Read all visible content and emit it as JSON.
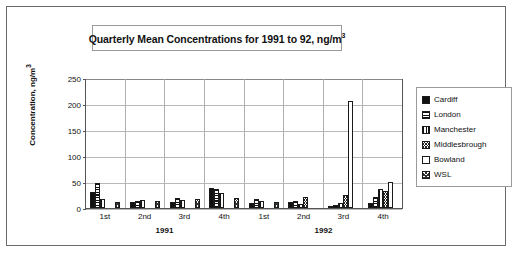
{
  "chart_data": {
    "type": "bar",
    "xlabel": "",
    "ylabel": "Concentration, ng/m³",
    "ylim": [
      0,
      250
    ],
    "yticks": [
      0,
      50,
      100,
      150,
      200,
      250
    ],
    "grid": true,
    "legend_position": "right",
    "categories": [
      "1st",
      "2nd",
      "3rd",
      "4th",
      "1st",
      "2nd",
      "3rd",
      "4th"
    ],
    "group_labels": [
      "1991",
      "1992"
    ],
    "series": [
      {
        "name": "Cardiff",
        "pattern": "solid-black",
        "values": [
          30,
          11,
          12,
          38,
          10,
          12,
          4,
          10
        ]
      },
      {
        "name": "London",
        "pattern": "horizontal-lines",
        "values": [
          48,
          14,
          20,
          37,
          17,
          14,
          6,
          22
        ]
      },
      {
        "name": "Manchester",
        "pattern": "vertical-lines",
        "values": [
          17,
          16,
          16,
          28,
          13,
          8,
          9,
          37
        ]
      },
      {
        "name": "Middlesbrough",
        "pattern": "crosshatch",
        "values": [
          0,
          0,
          0,
          0,
          0,
          22,
          25,
          33
        ]
      },
      {
        "name": "Bowland",
        "pattern": "white",
        "values": [
          0,
          0,
          0,
          0,
          0,
          0,
          205,
          50
        ]
      },
      {
        "name": "WSL",
        "pattern": "dotted-hatch",
        "values": [
          12,
          13,
          18,
          20,
          12,
          0,
          0,
          0
        ]
      }
    ]
  },
  "title": {
    "text_main": "Quarterly Mean Concentrations for 1991 to 92, ng/m",
    "text_sup": "3"
  },
  "axes": {
    "y_title_main": "Concentration, ng/m",
    "y_title_sup": "3",
    "y_ticks": [
      "250",
      "200",
      "150",
      "100",
      "50",
      "0"
    ],
    "x_ticks": [
      "1st",
      "2nd",
      "3rd",
      "4th",
      "1st",
      "2nd",
      "3rd",
      "4th"
    ],
    "years": [
      "1991",
      "1992"
    ]
  },
  "legend": {
    "items": [
      {
        "label": "Cardiff"
      },
      {
        "label": "London"
      },
      {
        "label": "Manchester"
      },
      {
        "label": "Middlesbrough"
      },
      {
        "label": "Bowland"
      },
      {
        "label": "WSL"
      }
    ]
  }
}
